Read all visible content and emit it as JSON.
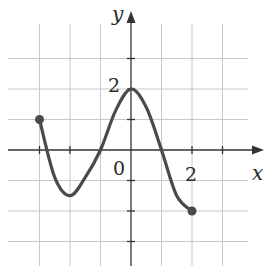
{
  "chart_data": {
    "type": "line",
    "title": "",
    "xlabel": "x",
    "ylabel": "y",
    "tick_labels": {
      "origin": "0",
      "x": [
        "2"
      ],
      "y": [
        "2"
      ]
    },
    "xlim": [
      -4,
      3.8
    ],
    "ylim": [
      -3.8,
      4.1
    ],
    "grid": true,
    "grid_spacing": 1,
    "legend": null,
    "series": [
      {
        "name": "f(x)",
        "x": [
          -3,
          -2.5,
          -2,
          -1.5,
          -1,
          -0.5,
          0,
          0.5,
          1,
          1.5,
          2
        ],
        "y": [
          1,
          -0.9,
          -1.5,
          -0.9,
          0,
          1.3,
          2,
          1.4,
          0,
          -1.5,
          -2
        ],
        "endpoints": [
          {
            "x": -3,
            "y": 1,
            "filled": true
          },
          {
            "x": 2,
            "y": -2,
            "filled": true
          }
        ],
        "color": "#4a4a4a"
      }
    ]
  },
  "labels": {
    "x_axis": "x",
    "y_axis": "y",
    "origin": "0",
    "x_tick": "2",
    "y_tick": "2"
  },
  "colors": {
    "grid": "#c8c8c8",
    "axis": "#333333",
    "curve": "#4a4a4a"
  }
}
